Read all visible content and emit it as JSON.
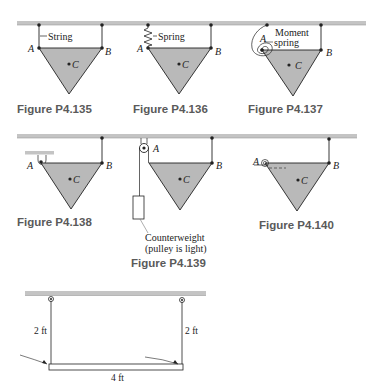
{
  "colors": {
    "ceiling": "#c4c4c4",
    "plate_fill": "#b9b9b9",
    "line": "#222222",
    "caption": "#5a5a5a"
  },
  "figures": [
    {
      "id": "P4.135",
      "caption": "Figure P4.135",
      "labels": {
        "a": "A",
        "b": "B",
        "c": "C",
        "support": "String"
      }
    },
    {
      "id": "P4.136",
      "caption": "Figure P4.136",
      "labels": {
        "a": "A",
        "b": "B",
        "c": "C",
        "support": "Spring"
      }
    },
    {
      "id": "P4.137",
      "caption": "Figure P4.137",
      "labels": {
        "a": "A",
        "b": "B",
        "c": "C",
        "support_line1": "Moment",
        "support_line2": "spring"
      }
    },
    {
      "id": "P4.138",
      "caption": "Figure P4.138",
      "labels": {
        "a": "A",
        "b": "B",
        "c": "C"
      }
    },
    {
      "id": "P4.139",
      "caption": "Figure P4.139",
      "labels": {
        "a": "A",
        "b": "B",
        "c": "C",
        "note_line1": "Counterweight",
        "note_line2": "(pulley is light)"
      }
    },
    {
      "id": "P4.140",
      "caption": "Figure P4.140",
      "labels": {
        "a": "A",
        "b": "B",
        "c": "C"
      }
    },
    {
      "id": "bottom",
      "labels": {
        "left_length": "2 ft",
        "right_length": "2 ft",
        "width": "4 ft"
      }
    }
  ]
}
